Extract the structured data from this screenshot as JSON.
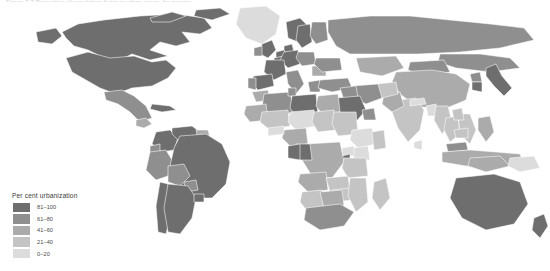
{
  "caption": {
    "text": "Figure 3.2  Proportion of population living in urban areas, by country"
  },
  "legend": {
    "title": "Per cent urbanization",
    "items": [
      {
        "label": "81–100",
        "color": "#6e6e6e"
      },
      {
        "label": "61–80",
        "color": "#8f8f8f"
      },
      {
        "label": "41–60",
        "color": "#ababab"
      },
      {
        "label": "21–40",
        "color": "#c4c4c4"
      },
      {
        "label": "0–20",
        "color": "#dcdcdc"
      }
    ]
  },
  "map": {
    "background": "#ffffff",
    "border_color": "#ffffff",
    "projection": "equirectangular-clipped",
    "no_data_color": "#ffffff"
  },
  "chart_data": {
    "type": "heatmap",
    "legend_position": "bottom-left",
    "categories": [
      "81–100",
      "61–80",
      "41–60",
      "21–40",
      "0–20"
    ],
    "colors": [
      "#6e6e6e",
      "#8f8f8f",
      "#ababab",
      "#c4c4c4",
      "#dcdcdc"
    ],
    "regions": [
      {
        "name": "Canada",
        "class": 0
      },
      {
        "name": "United States",
        "class": 0
      },
      {
        "name": "Greenland",
        "class": 4
      },
      {
        "name": "Mexico",
        "class": 1
      },
      {
        "name": "Guatemala",
        "class": 2
      },
      {
        "name": "Cuba",
        "class": 0
      },
      {
        "name": "Brazil",
        "class": 0
      },
      {
        "name": "Argentina",
        "class": 0
      },
      {
        "name": "Chile",
        "class": 0
      },
      {
        "name": "Venezuela",
        "class": 0
      },
      {
        "name": "Colombia",
        "class": 0
      },
      {
        "name": "Peru",
        "class": 1
      },
      {
        "name": "Bolivia",
        "class": 1
      },
      {
        "name": "Paraguay",
        "class": 1
      },
      {
        "name": "Uruguay",
        "class": 0
      },
      {
        "name": "Ecuador",
        "class": 1
      },
      {
        "name": "Guyana",
        "class": 2
      },
      {
        "name": "United Kingdom",
        "class": 0
      },
      {
        "name": "Ireland",
        "class": 1
      },
      {
        "name": "France",
        "class": 0
      },
      {
        "name": "Spain",
        "class": 0
      },
      {
        "name": "Portugal",
        "class": 1
      },
      {
        "name": "Germany",
        "class": 0
      },
      {
        "name": "Netherlands",
        "class": 0
      },
      {
        "name": "Belgium",
        "class": 0
      },
      {
        "name": "Denmark",
        "class": 0
      },
      {
        "name": "Norway",
        "class": 0
      },
      {
        "name": "Sweden",
        "class": 0
      },
      {
        "name": "Finland",
        "class": 1
      },
      {
        "name": "Poland",
        "class": 1
      },
      {
        "name": "Italy",
        "class": 1
      },
      {
        "name": "Greece",
        "class": 1
      },
      {
        "name": "Ukraine",
        "class": 1
      },
      {
        "name": "Romania",
        "class": 2
      },
      {
        "name": "Russia",
        "class": 1
      },
      {
        "name": "Kazakhstan",
        "class": 2
      },
      {
        "name": "Turkey",
        "class": 1
      },
      {
        "name": "Iran",
        "class": 1
      },
      {
        "name": "Iraq",
        "class": 1
      },
      {
        "name": "Saudi Arabia",
        "class": 0
      },
      {
        "name": "Oman",
        "class": 1
      },
      {
        "name": "Yemen",
        "class": 4
      },
      {
        "name": "Egypt",
        "class": 2
      },
      {
        "name": "Libya",
        "class": 0
      },
      {
        "name": "Algeria",
        "class": 1
      },
      {
        "name": "Morocco",
        "class": 2
      },
      {
        "name": "Tunisia",
        "class": 1
      },
      {
        "name": "Mauritania",
        "class": 2
      },
      {
        "name": "Mali",
        "class": 3
      },
      {
        "name": "Niger",
        "class": 4
      },
      {
        "name": "Nigeria",
        "class": 2
      },
      {
        "name": "Chad",
        "class": 3
      },
      {
        "name": "Sudan",
        "class": 3
      },
      {
        "name": "Ethiopia",
        "class": 4
      },
      {
        "name": "Somalia",
        "class": 3
      },
      {
        "name": "Kenya",
        "class": 4
      },
      {
        "name": "Uganda",
        "class": 4
      },
      {
        "name": "Tanzania",
        "class": 3
      },
      {
        "name": "Dem. Rep. Congo",
        "class": 2
      },
      {
        "name": "Congo",
        "class": 0
      },
      {
        "name": "Gabon",
        "class": 0
      },
      {
        "name": "Angola",
        "class": 2
      },
      {
        "name": "Zambia",
        "class": 3
      },
      {
        "name": "Zimbabwe",
        "class": 3
      },
      {
        "name": "Mozambique",
        "class": 3
      },
      {
        "name": "Madagascar",
        "class": 3
      },
      {
        "name": "South Africa",
        "class": 1
      },
      {
        "name": "Namibia",
        "class": 3
      },
      {
        "name": "Botswana",
        "class": 2
      },
      {
        "name": "Burkina Faso",
        "class": 4
      },
      {
        "name": "Rwanda",
        "class": 0
      },
      {
        "name": "India",
        "class": 3
      },
      {
        "name": "Pakistan",
        "class": 2
      },
      {
        "name": "Afghanistan",
        "class": 3
      },
      {
        "name": "China",
        "class": 2
      },
      {
        "name": "Mongolia",
        "class": 1
      },
      {
        "name": "Japan",
        "class": 0
      },
      {
        "name": "South Korea",
        "class": 0
      },
      {
        "name": "North Korea",
        "class": 1
      },
      {
        "name": "Vietnam",
        "class": 3
      },
      {
        "name": "Thailand",
        "class": 3
      },
      {
        "name": "Myanmar",
        "class": 3
      },
      {
        "name": "Cambodia",
        "class": 3
      },
      {
        "name": "Laos",
        "class": 3
      },
      {
        "name": "Malaysia",
        "class": 1
      },
      {
        "name": "Indonesia",
        "class": 2
      },
      {
        "name": "Philippines",
        "class": 2
      },
      {
        "name": "Papua New Guinea",
        "class": 4
      },
      {
        "name": "Australia",
        "class": 0
      },
      {
        "name": "New Zealand",
        "class": 0
      },
      {
        "name": "Bangladesh",
        "class": 4
      },
      {
        "name": "Nepal",
        "class": 4
      },
      {
        "name": "Sri Lanka",
        "class": 4
      }
    ]
  }
}
